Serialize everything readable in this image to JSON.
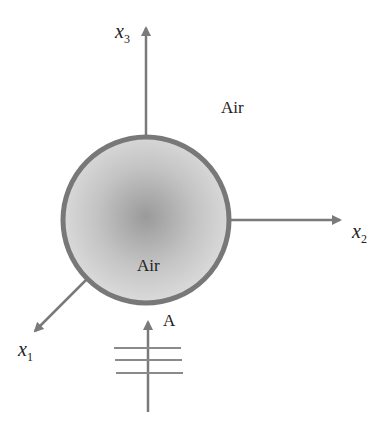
{
  "diagram": {
    "axes": {
      "x1": {
        "label": "x",
        "subscript": "1"
      },
      "x2": {
        "label": "x",
        "subscript": "2"
      },
      "x3": {
        "label": "x",
        "subscript": "3"
      }
    },
    "labels": {
      "outside_medium": "Air",
      "inside_medium": "Air",
      "incident_wave": "A"
    },
    "sphere": {
      "center": [
        146,
        220
      ],
      "radius": 85,
      "shell_color": "#787878",
      "fill_center": "#9a9a9a",
      "fill_edge": "#dcdcdc"
    },
    "axis_color": "#7a7a7a"
  }
}
